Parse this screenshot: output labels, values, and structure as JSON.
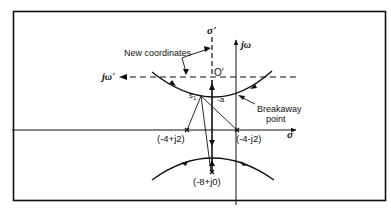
{
  "diagram": {
    "title": "",
    "type": "root-locus",
    "labels": {
      "new_coordinates": "New coordinates",
      "sigma_prime": "σ'",
      "j_omega": "jω",
      "j_omega_prime": "jω'",
      "o_prime": "O'",
      "sigma": "σ",
      "s1": "s",
      "s1_sub": "1",
      "minus_a": "-a",
      "breakaway_line1": "Breakaway",
      "breakaway_line2": "point",
      "pole_left": "(-4+j2)",
      "pole_right": "(-4-j2)",
      "pole_bottom": "(-8+j0)"
    },
    "poles": [
      {
        "label": "(-4+j2)",
        "real": -4,
        "imag": 2
      },
      {
        "label": "(-4-j2)",
        "real": -4,
        "imag": -2
      },
      {
        "label": "(-8+j0)",
        "real": -8,
        "imag": 0
      }
    ],
    "colors": {
      "line": "#111111",
      "background": "#ffffff"
    }
  }
}
